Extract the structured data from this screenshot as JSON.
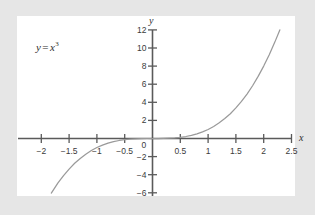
{
  "figure": {
    "background_color": "#e6e6e6",
    "panel_color": "#ffffff",
    "axis_color": "#5a5a5a",
    "curve_color": "#9a9a9a",
    "text_color": "#3b3b3b"
  },
  "equation": {
    "lhs": "y",
    "operator": "=",
    "base": "x",
    "exponent": "3"
  },
  "axis_names": {
    "x": "x",
    "y": "y"
  },
  "chart_data": {
    "type": "line",
    "title": "",
    "annotation": "y = x^3",
    "xlabel": "x",
    "ylabel": "y",
    "xlim": [
      -2.35,
      2.72
    ],
    "ylim": [
      -6.6,
      12.6
    ],
    "grid": false,
    "legend": false,
    "axis_style": "crossed-at-origin",
    "xticks": [
      -2,
      -1.5,
      -1,
      -0.5,
      0,
      0.5,
      1,
      1.5,
      2,
      2.5
    ],
    "xtick_labels": [
      "-2",
      "-1.5",
      "-1",
      "-0.5",
      "0",
      "0.5",
      "1",
      "1.5",
      "2",
      "2.5"
    ],
    "yticks": [
      -6,
      -4,
      -2,
      2,
      4,
      6,
      8,
      10,
      12
    ],
    "ytick_labels": [
      "-6",
      "-4",
      "-2",
      "2",
      "4",
      "6",
      "8",
      "10",
      "12"
    ],
    "origin_label": "0",
    "series": [
      {
        "name": "y = x^3",
        "color": "#9a9a9a",
        "x": [
          -1.82,
          -1.7,
          -1.6,
          -1.5,
          -1.4,
          -1.3,
          -1.2,
          -1.1,
          -1.0,
          -0.9,
          -0.8,
          -0.7,
          -0.6,
          -0.5,
          -0.4,
          -0.3,
          -0.2,
          -0.1,
          0,
          0.1,
          0.2,
          0.3,
          0.4,
          0.5,
          0.6,
          0.7,
          0.8,
          0.9,
          1.0,
          1.1,
          1.2,
          1.3,
          1.4,
          1.5,
          1.6,
          1.7,
          1.8,
          1.9,
          2.0,
          2.1,
          2.2,
          2.29
        ],
        "y": [
          -6.03,
          -4.91,
          -4.1,
          -3.38,
          -2.74,
          -2.2,
          -1.73,
          -1.33,
          -1.0,
          -0.73,
          -0.51,
          -0.34,
          -0.22,
          -0.13,
          -0.06,
          -0.03,
          -0.01,
          0.0,
          0.0,
          0.0,
          0.01,
          0.03,
          0.06,
          0.13,
          0.22,
          0.34,
          0.51,
          0.73,
          1.0,
          1.33,
          1.73,
          2.2,
          2.74,
          3.38,
          4.1,
          4.91,
          5.83,
          6.86,
          8.0,
          9.26,
          10.65,
          12.0
        ]
      }
    ]
  }
}
